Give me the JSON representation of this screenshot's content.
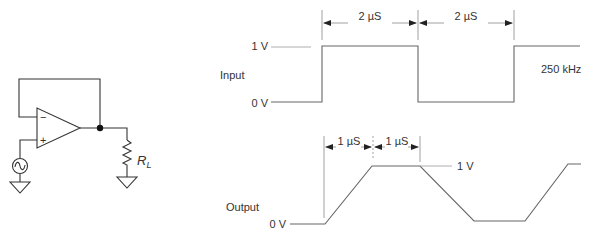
{
  "circuit": {
    "title": "Unity-gain voltage follower with load",
    "opamp": {
      "inverting_label": "−",
      "noninverting_label": "+"
    },
    "load_label": "R",
    "load_subscript": "L",
    "source": "ac-signal-source",
    "ground": "ground-symbol"
  },
  "waveforms": {
    "input": {
      "label": "Input",
      "high_label": "1 V",
      "low_label": "0 V",
      "frequency_label": "250 kHz",
      "intervals": [
        {
          "label": "2 µS"
        },
        {
          "label": "2 µS"
        }
      ]
    },
    "output": {
      "label": "Output",
      "high_label": "1 V",
      "low_label": "0 V",
      "intervals": [
        {
          "label": "1 µS"
        },
        {
          "label": "1 µS"
        }
      ]
    }
  },
  "colors": {
    "wire": "#333333",
    "waveform": "#666666",
    "text": "#333333"
  }
}
